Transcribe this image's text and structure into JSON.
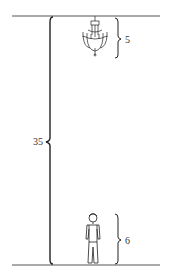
{
  "diagram": {
    "total_height_label": "35",
    "chandelier_height_label": "5",
    "person_height_label": "6",
    "line_color": "#333333"
  }
}
